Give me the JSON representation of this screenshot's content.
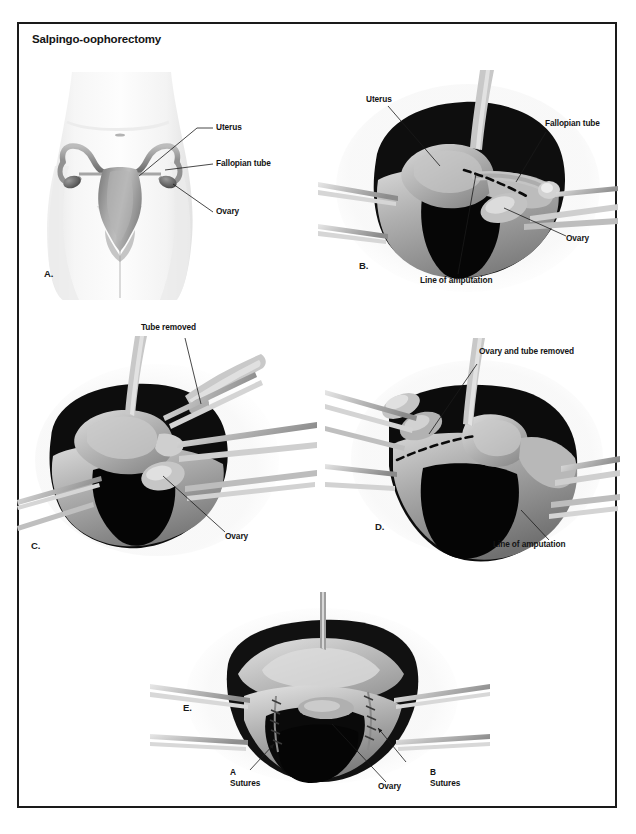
{
  "document": {
    "title": "Salpingo-oophorectomy"
  },
  "panels": [
    {
      "letter": "A.",
      "name": "panel-a-anatomy-overview",
      "labels": [
        {
          "text": "Uterus",
          "name": "label-uterus"
        },
        {
          "text": "Fallopian tube",
          "name": "label-fallopian-tube"
        },
        {
          "text": "Ovary",
          "name": "label-ovary"
        }
      ]
    },
    {
      "letter": "B.",
      "name": "panel-b-exposed-field",
      "labels": [
        {
          "text": "Uterus",
          "name": "label-uterus"
        },
        {
          "text": "Fallopian tube",
          "name": "label-fallopian-tube"
        },
        {
          "text": "Ovary",
          "name": "label-ovary"
        },
        {
          "text": "Line of amputation",
          "name": "label-line-of-amputation"
        }
      ]
    },
    {
      "letter": "C.",
      "name": "panel-c-tube-removed",
      "labels": [
        {
          "text": "Tube removed",
          "name": "label-tube-removed"
        },
        {
          "text": "Ovary",
          "name": "label-ovary"
        }
      ]
    },
    {
      "letter": "D.",
      "name": "panel-d-ovary-and-tube-removed",
      "labels": [
        {
          "text": "Ovary and tube removed",
          "name": "label-ovary-and-tube-removed"
        },
        {
          "text": "Line of amputation",
          "name": "label-line-of-amputation"
        }
      ]
    },
    {
      "letter": "E.",
      "name": "panel-e-sutures",
      "labels": [
        {
          "text": "A",
          "name": "label-suture-a-letter"
        },
        {
          "text": "Sutures",
          "name": "label-suture-a-word"
        },
        {
          "text": "Ovary",
          "name": "label-ovary"
        },
        {
          "text": "B",
          "name": "label-suture-b-letter"
        },
        {
          "text": "Sutures",
          "name": "label-suture-b-word"
        }
      ]
    }
  ],
  "colors": {
    "frame_border": "#1a1a1a",
    "text": "#141414",
    "tissue_dark": "#101010",
    "tissue_mid": "#6e6e6e",
    "tissue_light": "#cfcfcf",
    "background": "#ffffff"
  }
}
